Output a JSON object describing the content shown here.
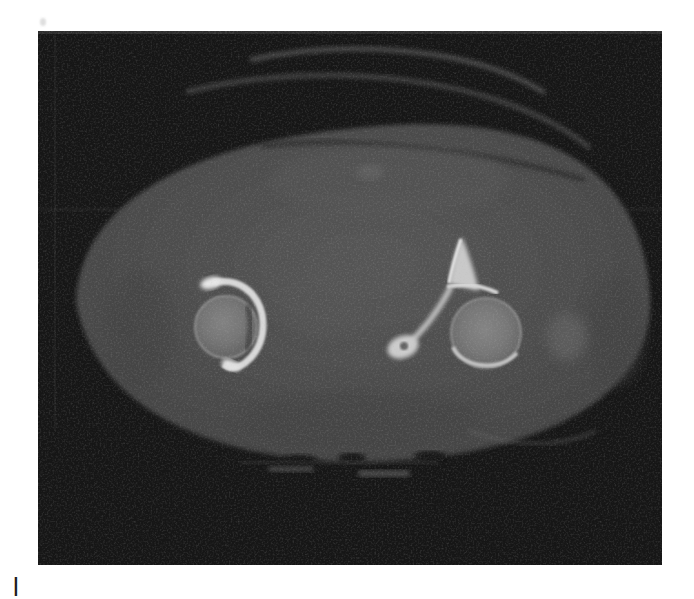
{
  "figure": {
    "label": "axial-pelvic-ct-scan",
    "alt": "Axial CT slice of the pelvis at hip-joint level showing both femoral heads seated in bright acetabula, soft-tissue oval of the body on a black scan field",
    "caption_fragment": "l",
    "colors": {
      "page_background": "#ffffff",
      "scan_background": "#161616",
      "soft_tissue": "#4c4c4c",
      "bone_cortex": "#d9d9d9",
      "femoral_head": "#787878"
    }
  }
}
